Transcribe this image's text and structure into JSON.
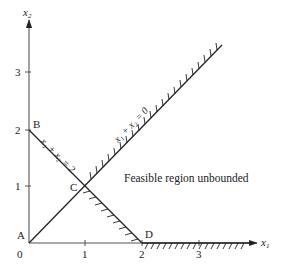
{
  "figure": {
    "type": "linear-programming-feasible-region",
    "axes": {
      "x_label": "x",
      "x_label_sub": "1",
      "y_label": "x",
      "y_label_sub": "2",
      "origin_label": "0",
      "x_ticks": [
        "1",
        "2",
        "3"
      ],
      "y_ticks": [
        "1",
        "2",
        "3"
      ]
    },
    "points": {
      "A": {
        "label": "A",
        "coords": [
          0,
          0
        ]
      },
      "B": {
        "label": "B",
        "coords": [
          0,
          2
        ]
      },
      "C": {
        "label": "C",
        "coords": [
          1,
          1
        ]
      },
      "D": {
        "label": "D",
        "coords": [
          2,
          0
        ]
      }
    },
    "constraints": [
      {
        "name": "line-x1-plus-x2-eq-2",
        "label": "x₁ + x₂ = 2",
        "from": [
          0,
          2
        ],
        "to": [
          2,
          0
        ],
        "hatched_segment": "C-D"
      },
      {
        "name": "line-x1-x2-eq-0",
        "label": "x₁ + x₂ = 0",
        "from": [
          0,
          0
        ],
        "to": [
          3.4,
          3.45
        ],
        "hatched_segment": "C-end"
      },
      {
        "name": "x1-axis-boundary",
        "label": "",
        "from": [
          2,
          0
        ],
        "to": [
          4,
          0
        ],
        "hatched_segment": "D-end"
      }
    ],
    "annotation": "Feasible region unbounded",
    "colors": {
      "ink": "#222222",
      "axis": "#555555",
      "background": "#ffffff"
    }
  }
}
